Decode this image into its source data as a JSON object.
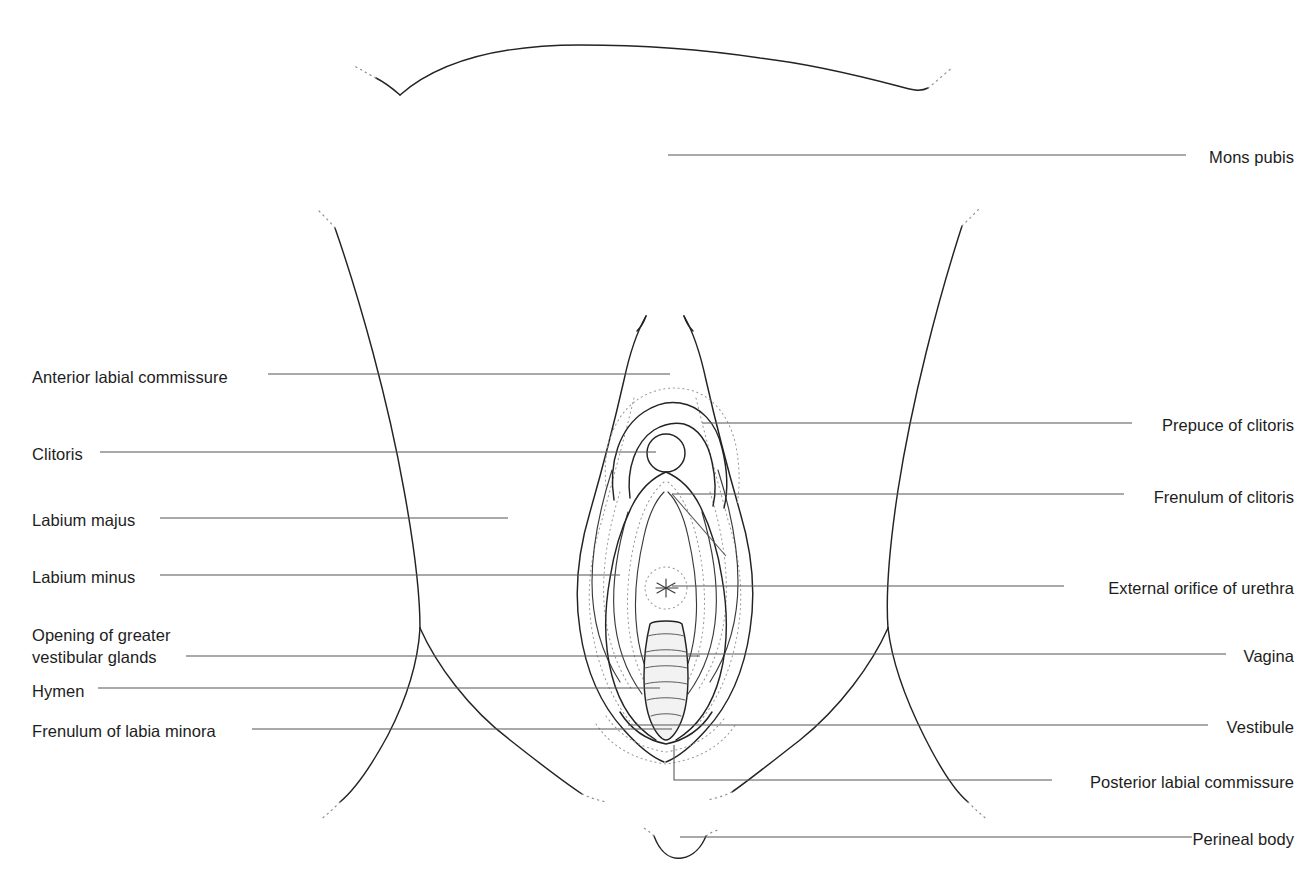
{
  "figure": {
    "background_color": "#ffffff",
    "line_color": "#232323",
    "leader_color": "#555555",
    "text_color": "#1d1d1d",
    "stipple_color": "#9a9a9a"
  },
  "labels_left": [
    {
      "id": "anterior-labial-commissure",
      "text": "Anterior labial commissure",
      "x": 32,
      "y": 366,
      "lines": 1
    },
    {
      "id": "clitoris",
      "text": "Clitoris",
      "x": 32,
      "y": 443,
      "lines": 1
    },
    {
      "id": "labium-majus",
      "text": "Labium majus",
      "x": 32,
      "y": 509,
      "lines": 1
    },
    {
      "id": "labium-minus",
      "text": "Labium minus",
      "x": 32,
      "y": 566,
      "lines": 1
    },
    {
      "id": "opening-of-greater-vestibular-glands",
      "text": "Opening of greater\nvestibular glands",
      "x": 32,
      "y": 624,
      "lines": 2
    },
    {
      "id": "hymen",
      "text": "Hymen",
      "x": 32,
      "y": 680,
      "lines": 1
    },
    {
      "id": "frenulum-of-labia-minora",
      "text": "Frenulum of labia minora",
      "x": 32,
      "y": 720,
      "lines": 1
    }
  ],
  "labels_right": [
    {
      "id": "mons-pubis",
      "text": "Mons pubis",
      "x_right": 1294,
      "y": 146,
      "lines": 1
    },
    {
      "id": "prepuce-of-clitoris",
      "text": "Prepuce of clitoris",
      "x_right": 1294,
      "y": 414,
      "lines": 1
    },
    {
      "id": "frenulum-of-clitoris",
      "text": "Frenulum of clitoris",
      "x_right": 1294,
      "y": 486,
      "lines": 1
    },
    {
      "id": "external-orifice-of-urethra",
      "text": "External orifice of urethra",
      "x_right": 1294,
      "y": 577,
      "lines": 1
    },
    {
      "id": "vagina",
      "text": "Vagina",
      "x_right": 1294,
      "y": 645,
      "lines": 1
    },
    {
      "id": "vestibule",
      "text": "Vestibule",
      "x_right": 1294,
      "y": 716,
      "lines": 1
    },
    {
      "id": "posterior-labial-commissure",
      "text": "Posterior labial commissure",
      "x_right": 1294,
      "y": 771,
      "lines": 1
    },
    {
      "id": "perineal-body",
      "text": "Perineal body",
      "x_right": 1294,
      "y": 828,
      "lines": 1
    }
  ],
  "leaders_left": [
    {
      "id": "leader-anterior-labial-commissure",
      "d": "M 268 374 L 670 374"
    },
    {
      "id": "leader-clitoris",
      "d": "M 100 452 L 656 452"
    },
    {
      "id": "leader-labium-majus",
      "d": "M 160 518 L 508 518"
    },
    {
      "id": "leader-labium-minus",
      "d": "M 160 575 L 620 575"
    },
    {
      "id": "leader-opening-of-greater-vestibular-glands",
      "d": "M 186 656 L 700 656"
    },
    {
      "id": "leader-hymen",
      "d": "M 98 688 L 660 688"
    },
    {
      "id": "leader-frenulum-of-labia-minora",
      "d": "M 252 729 L 672 729"
    }
  ],
  "leaders_right": [
    {
      "id": "leader-mons-pubis",
      "d": "M 1186 155 L 668 155"
    },
    {
      "id": "leader-prepuce-of-clitoris",
      "d": "M 1132 423 L 702 423"
    },
    {
      "id": "leader-frenulum-of-clitoris",
      "d": "M 1124 494 L 672 494"
    },
    {
      "id": "leader-external-orifice-of-urethra",
      "d": "M 1064 586 L 672 586"
    },
    {
      "id": "leader-vagina",
      "d": "M 1226 654 L 688 654"
    },
    {
      "id": "leader-vestibule",
      "d": "M 1208 725 L 628 725"
    },
    {
      "id": "leader-posterior-labial-commissure",
      "d": "M 1052 780 L 674 780 L 674 745"
    },
    {
      "id": "leader-perineal-body",
      "d": "M 1192 837 L 680 837"
    }
  ],
  "leader_crossings": [
    {
      "id": "crossing-frenulum-of-clitoris",
      "d": "M 672 494 L 726 556"
    }
  ],
  "anatomy_parts": [
    {
      "id": "mons-pubis-contour",
      "name": "mons-pubis-contour"
    },
    {
      "id": "thigh-left",
      "name": "thigh-crease-left"
    },
    {
      "id": "thigh-right",
      "name": "thigh-crease-right"
    },
    {
      "id": "labium-majus-left",
      "name": "labium-majus-left"
    },
    {
      "id": "labium-majus-right",
      "name": "labium-majus-right"
    },
    {
      "id": "labium-minus-left",
      "name": "labium-minus-left"
    },
    {
      "id": "labium-minus-right",
      "name": "labium-minus-right"
    },
    {
      "id": "prepuce-arc",
      "name": "prepuce-of-clitoris-arc"
    },
    {
      "id": "clitoris-glans",
      "name": "clitoris-glans-circle"
    },
    {
      "id": "urethral-orifice",
      "name": "external-urethral-orifice"
    },
    {
      "id": "vaginal-opening",
      "name": "vaginal-opening-with-rugae"
    },
    {
      "id": "perineal-body-arc",
      "name": "perineal-body-arc"
    }
  ],
  "vaginal_rugae_count": 6
}
